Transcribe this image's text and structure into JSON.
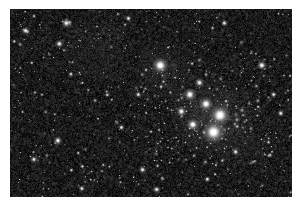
{
  "image": {
    "kind": "astronomical-photograph",
    "subject": "open star cluster in a dense Milky Way star field",
    "alt_text": "Grayscale astrophotograph showing a dense field of faint stars with a compact grouping of bright stars toward the right of centre",
    "caption": "",
    "frame": {
      "x": 10,
      "y": 9,
      "width": 282,
      "height": 188,
      "border_color": "#ffffff",
      "background_color": "#ffffff"
    },
    "palette": {
      "sky_dark": "#151515",
      "sky_mid": "#2e2e2e",
      "sky_light": "#4a4a4a",
      "nebulosity": "#585858",
      "star_core": "#ffffff",
      "star_halo": "#c8c8c8"
    },
    "render": {
      "noise_grain_count": 9000,
      "noise_min_gray": 14,
      "noise_max_gray": 78,
      "faint_star_count": 700,
      "seed": 20240517
    },
    "bright_stars": [
      {
        "name": "cluster-core-a",
        "x": 0.745,
        "y": 0.565,
        "r": 7.2,
        "mag": 1.0
      },
      {
        "name": "cluster-core-b",
        "x": 0.722,
        "y": 0.655,
        "r": 7.8,
        "mag": 1.0
      },
      {
        "name": "cluster-core-c",
        "x": 0.695,
        "y": 0.505,
        "r": 5.0,
        "mag": 0.92
      },
      {
        "name": "cluster-core-d",
        "x": 0.648,
        "y": 0.615,
        "r": 4.4,
        "mag": 0.9
      },
      {
        "name": "cluster-core-e",
        "x": 0.638,
        "y": 0.455,
        "r": 4.6,
        "mag": 0.9
      },
      {
        "name": "cluster-core-f",
        "x": 0.608,
        "y": 0.545,
        "r": 3.6,
        "mag": 0.85
      },
      {
        "name": "cluster-core-g",
        "x": 0.672,
        "y": 0.392,
        "r": 3.4,
        "mag": 0.82
      },
      {
        "name": "star-north-bright",
        "x": 0.533,
        "y": 0.3,
        "r": 5.6,
        "mag": 1.0
      },
      {
        "name": "star-ne-bright",
        "x": 0.893,
        "y": 0.3,
        "r": 3.6,
        "mag": 0.86
      },
      {
        "name": "star-upper-left",
        "x": 0.2,
        "y": 0.075,
        "r": 3.4,
        "mag": 0.85
      },
      {
        "name": "star-left-edge",
        "x": 0.055,
        "y": 0.115,
        "r": 2.8,
        "mag": 0.8
      },
      {
        "name": "star-left-mid",
        "x": 0.175,
        "y": 0.185,
        "r": 3.0,
        "mag": 0.82
      },
      {
        "name": "star-left-low",
        "x": 0.17,
        "y": 0.7,
        "r": 3.2,
        "mag": 0.84
      },
      {
        "name": "star-lower-left",
        "x": 0.085,
        "y": 0.8,
        "r": 2.6,
        "mag": 0.78
      },
      {
        "name": "star-centre-low",
        "x": 0.47,
        "y": 0.855,
        "r": 2.8,
        "mag": 0.8
      },
      {
        "name": "star-bottom-centre",
        "x": 0.52,
        "y": 0.96,
        "r": 2.8,
        "mag": 0.8
      },
      {
        "name": "star-right-low",
        "x": 0.8,
        "y": 0.76,
        "r": 2.6,
        "mag": 0.78
      },
      {
        "name": "star-far-right",
        "x": 0.96,
        "y": 0.555,
        "r": 2.6,
        "mag": 0.78
      },
      {
        "name": "star-right-upper",
        "x": 0.935,
        "y": 0.455,
        "r": 2.4,
        "mag": 0.75
      },
      {
        "name": "star-mid-field",
        "x": 0.455,
        "y": 0.455,
        "r": 2.4,
        "mag": 0.75
      },
      {
        "name": "star-mid-low",
        "x": 0.395,
        "y": 0.63,
        "r": 2.4,
        "mag": 0.75
      },
      {
        "name": "star-top-right",
        "x": 0.76,
        "y": 0.075,
        "r": 2.6,
        "mag": 0.78
      },
      {
        "name": "star-top-centre",
        "x": 0.42,
        "y": 0.05,
        "r": 2.4,
        "mag": 0.75
      },
      {
        "name": "star-lower-right",
        "x": 0.7,
        "y": 0.905,
        "r": 2.4,
        "mag": 0.75
      },
      {
        "name": "star-bottom-left",
        "x": 0.255,
        "y": 0.955,
        "r": 2.4,
        "mag": 0.75
      }
    ],
    "nebulosity_patches": [
      {
        "x": 0.71,
        "y": 0.58,
        "r": 0.17,
        "alpha": 0.28
      },
      {
        "x": 0.55,
        "y": 0.33,
        "r": 0.12,
        "alpha": 0.18
      },
      {
        "x": 0.3,
        "y": 0.2,
        "r": 0.16,
        "alpha": 0.1
      },
      {
        "x": 0.85,
        "y": 0.72,
        "r": 0.14,
        "alpha": 0.08
      }
    ]
  }
}
